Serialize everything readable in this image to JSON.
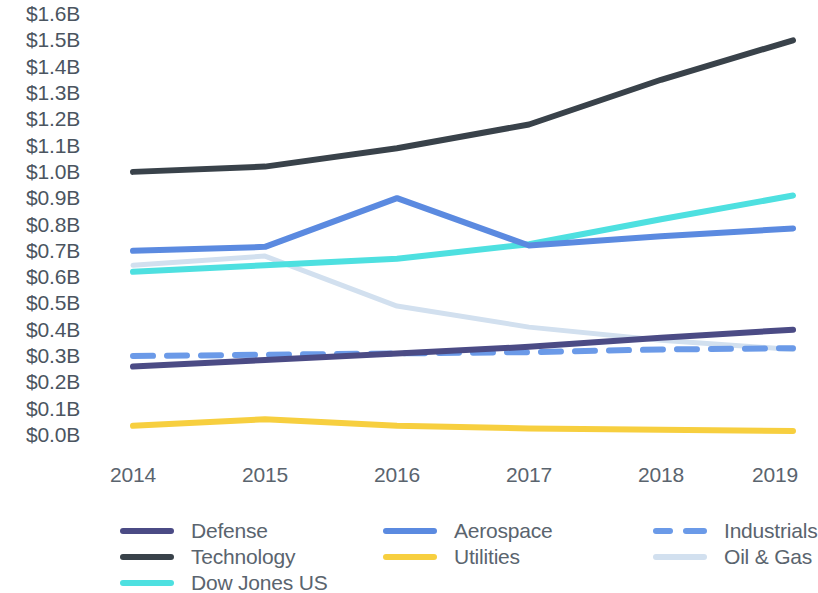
{
  "chart_data": {
    "type": "line",
    "title": "",
    "xlabel": "",
    "ylabel": "",
    "categories": [
      "2014",
      "2015",
      "2016",
      "2017",
      "2018",
      "2019"
    ],
    "x": [
      2014,
      2015,
      2016,
      2017,
      2018,
      2019
    ],
    "ylim": [
      0.0,
      1.6
    ],
    "ytick_labels": [
      "$1.6B",
      "$1.5B",
      "$1.4B",
      "$1.3B",
      "$1.2B",
      "$1.1B",
      "$1.0B",
      "$0.9B",
      "$0.8B",
      "$0.7B",
      "$0.6B",
      "$0.5B",
      "$0.4B",
      "$0.3B",
      "$0.2B",
      "$0.1B",
      "$0.0B"
    ],
    "ytick_values": [
      1.6,
      1.5,
      1.4,
      1.3,
      1.2,
      1.1,
      1.0,
      0.9,
      0.8,
      0.7,
      0.6,
      0.5,
      0.4,
      0.3,
      0.2,
      0.1,
      0.0
    ],
    "grid": false,
    "legend_position": "bottom",
    "value_unit": "billions of USD",
    "series": [
      {
        "name": "Defense",
        "color": "#4b4b85",
        "style": "solid",
        "values": [
          0.26,
          0.285,
          0.31,
          0.335,
          0.37,
          0.4
        ]
      },
      {
        "name": "Technology",
        "color": "#39424a",
        "style": "solid",
        "values": [
          1.0,
          1.02,
          1.09,
          1.18,
          1.35,
          1.5
        ]
      },
      {
        "name": "Dow Jones US",
        "color": "#4ee0e0",
        "style": "solid",
        "values": [
          0.62,
          0.645,
          0.67,
          0.725,
          0.82,
          0.91
        ]
      },
      {
        "name": "Aerospace",
        "color": "#5b8ae0",
        "style": "solid",
        "values": [
          0.7,
          0.715,
          0.9,
          0.72,
          0.755,
          0.785
        ]
      },
      {
        "name": "Utilities",
        "color": "#f7cf3f",
        "style": "solid",
        "values": [
          0.035,
          0.06,
          0.035,
          0.025,
          0.02,
          0.015
        ]
      },
      {
        "name": "Industrials",
        "color": "#6b9ae8",
        "style": "dashed",
        "values": [
          0.3,
          0.305,
          0.31,
          0.315,
          0.325,
          0.33
        ]
      },
      {
        "name": "Oil & Gas",
        "color": "#d2e0ef",
        "style": "solid",
        "values": [
          0.645,
          0.68,
          0.49,
          0.41,
          0.36,
          0.325
        ]
      }
    ]
  },
  "legend": {
    "columns": [
      {
        "items": [
          {
            "label": "Defense",
            "series": 0
          },
          {
            "label": "Technology",
            "series": 1
          },
          {
            "label": "Dow Jones US",
            "series": 2
          }
        ]
      },
      {
        "items": [
          {
            "label": "Aerospace",
            "series": 3
          },
          {
            "label": "Utilities",
            "series": 4
          }
        ]
      },
      {
        "items": [
          {
            "label": "Industrials",
            "series": 5
          },
          {
            "label": "Oil & Gas",
            "series": 6
          }
        ]
      }
    ]
  },
  "colors": {
    "axis_text": "#4b5560",
    "tick_text": "#5a646e",
    "background": "#ffffff"
  }
}
